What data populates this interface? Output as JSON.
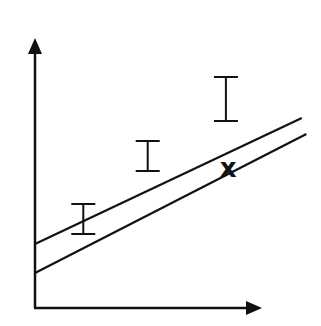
{
  "diagram": {
    "stroke_color": "#111111",
    "background": "#ffffff",
    "axes": {
      "x_label": "",
      "y_label": ""
    },
    "lines": [
      {
        "name": "upper-line",
        "from": [
          0,
          0.64
        ],
        "to": [
          1.16,
          1.9
        ]
      },
      {
        "name": "lower-line",
        "from": [
          0,
          0.35
        ],
        "to": [
          1.18,
          1.74
        ]
      }
    ],
    "error_bars": [
      {
        "x": 0.21,
        "top": 1.04,
        "bottom": 0.74
      },
      {
        "x": 0.49,
        "top": 1.67,
        "bottom": 1.37
      },
      {
        "x": 0.83,
        "top": 2.31,
        "bottom": 1.87
      }
    ],
    "outlier": {
      "x": 0.84,
      "y": 1.39,
      "symbol": "x"
    }
  }
}
